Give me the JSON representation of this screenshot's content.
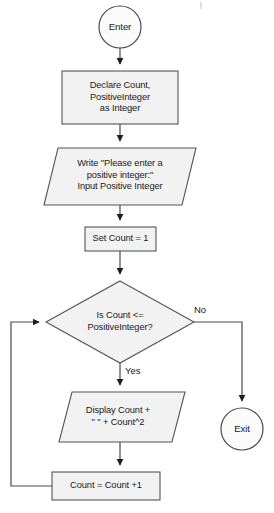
{
  "diagram": {
    "canvas": {
      "width": 274,
      "height": 513,
      "background": "#ffffff"
    },
    "style": {
      "shape_fill": "#f2f2f2",
      "shape_stroke": "#555555",
      "terminator_fill": "#fbfbfb",
      "connector_stroke": "#4a4a4a",
      "text_color": "#1a1a1a"
    },
    "nodes": [
      {
        "id": "enter",
        "type": "terminator",
        "label": "Enter",
        "cx": 120,
        "cy": 27,
        "r": 21
      },
      {
        "id": "declare",
        "type": "process",
        "label_lines": [
          "Declare Count,",
          "PositiveInteger",
          "as Integer"
        ],
        "x": 62,
        "y": 71,
        "w": 116,
        "h": 53
      },
      {
        "id": "write-input",
        "type": "input-output",
        "label_lines": [
          "Write \"Please enter a",
          "positive integer:\"",
          "Input Positive Integer"
        ],
        "x": 44,
        "y": 148,
        "w": 152,
        "h": 57
      },
      {
        "id": "set-count",
        "type": "process",
        "label_lines": [
          "Set Count = 1"
        ],
        "x": 85,
        "y": 227,
        "w": 71,
        "h": 24
      },
      {
        "id": "decision",
        "type": "decision",
        "label_lines": [
          "Is Count <=",
          "PositiveInteger?"
        ],
        "cx": 120,
        "cy": 322,
        "hw": 74,
        "hh": 41
      },
      {
        "id": "display",
        "type": "input-output",
        "label_lines": [
          "Display Count +",
          "\" \" + Count^2"
        ],
        "x": 59,
        "y": 392,
        "w": 126,
        "h": 50
      },
      {
        "id": "increment",
        "type": "process",
        "label_lines": [
          "Count = Count +1"
        ],
        "x": 52,
        "y": 472,
        "w": 108,
        "h": 28
      },
      {
        "id": "exit",
        "type": "terminator",
        "label": "Exit",
        "cx": 242,
        "cy": 429,
        "r": 21
      }
    ],
    "edges": [
      {
        "id": "enter-to-declare",
        "from": "enter",
        "to": "declare",
        "label": ""
      },
      {
        "id": "declare-to-write",
        "from": "declare",
        "to": "write-input",
        "label": ""
      },
      {
        "id": "write-to-set",
        "from": "write-input",
        "to": "set-count",
        "label": ""
      },
      {
        "id": "set-to-decision",
        "from": "set-count",
        "to": "decision",
        "label": ""
      },
      {
        "id": "decision-no-to-exit",
        "from": "decision",
        "to": "exit",
        "label": "No"
      },
      {
        "id": "decision-yes-to-display",
        "from": "decision",
        "to": "display",
        "label": "Yes"
      },
      {
        "id": "display-to-increment",
        "from": "display",
        "to": "increment",
        "label": ""
      },
      {
        "id": "increment-to-decision",
        "from": "increment",
        "to": "decision",
        "label": ""
      }
    ],
    "edge_labels": {
      "no": "No",
      "yes": "Yes"
    }
  }
}
